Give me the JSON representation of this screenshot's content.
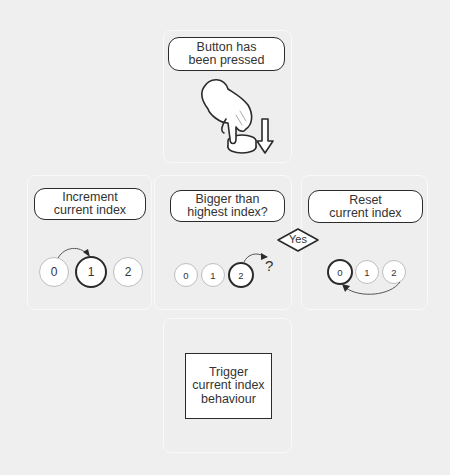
{
  "diagram": {
    "background": "#efefef",
    "steps": [
      {
        "id": "button-pressed",
        "label": "Button has\nbeen pressed",
        "icon": "hand-pressing-button"
      },
      {
        "id": "increment",
        "label": "Increment\ncurrent index",
        "circles": [
          "0",
          "1",
          "2"
        ],
        "active_index": 1
      },
      {
        "id": "check",
        "label": "Bigger than\nhighest index?",
        "circles": [
          "0",
          "1",
          "2"
        ],
        "active_index": 2,
        "question_mark": "?"
      },
      {
        "id": "reset",
        "label": "Reset\ncurrent index",
        "circles": [
          "0",
          "1",
          "2"
        ],
        "active_index": 0
      },
      {
        "id": "trigger",
        "label": "Trigger\ncurrent index\nbehaviour"
      }
    ],
    "decision": {
      "label": "Yes"
    }
  }
}
